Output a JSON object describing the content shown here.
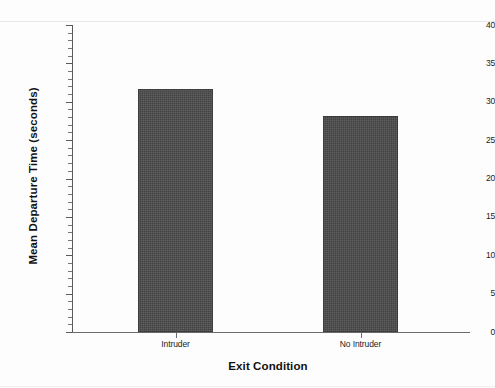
{
  "chart_data": {
    "type": "bar",
    "title": "",
    "xlabel": "Exit Condition",
    "ylabel": "Mean Departure Time (seconds)",
    "categories": [
      "Intruder",
      "No Intruder"
    ],
    "values": [
      31.6,
      28.1
    ],
    "ylim": [
      0,
      40
    ],
    "ytick_labels": [
      "0",
      "5",
      "10",
      "15",
      "20",
      "25",
      "30",
      "35",
      "40"
    ],
    "ytick_values": [
      0,
      5,
      10,
      15,
      20,
      25,
      30,
      35,
      40
    ],
    "y_minor_tick_interval": 1,
    "grid": false,
    "legend": null,
    "bar_color": "#4a4a4a",
    "axis_color": "#5a5a5a",
    "background_color": "#fdfdfd"
  }
}
